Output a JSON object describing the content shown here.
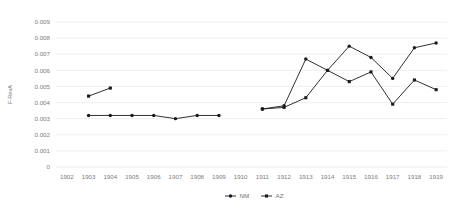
{
  "chart_data": {
    "type": "line",
    "title": "",
    "xlabel": "",
    "ylabel": "F-RevA",
    "ylim": [
      0,
      0.009
    ],
    "ytick_values": [
      0,
      0.001,
      0.002,
      0.003,
      0.004,
      0.005,
      0.006,
      0.007,
      0.008,
      0.009
    ],
    "ytick_labels": [
      "0",
      "0.001",
      "0.002",
      "0.003",
      "0.004",
      "0.005",
      "0.006",
      "0.007",
      "0.008",
      "0.009"
    ],
    "categories": [
      1902,
      1903,
      1904,
      1905,
      1906,
      1907,
      1908,
      1909,
      1910,
      1911,
      1912,
      1913,
      1914,
      1915,
      1916,
      1917,
      1918,
      1919
    ],
    "xtick_labels": [
      "1902",
      "1903",
      "1904",
      "1905",
      "1906",
      "1907",
      "1908",
      "1909",
      "1910",
      "1911",
      "1912",
      "1913",
      "1914",
      "1915",
      "1916",
      "1917",
      "1918",
      "1919"
    ],
    "grid": true,
    "grid_axis": "y",
    "legend_position": "bottom",
    "series": [
      {
        "name": "NM",
        "marker": "circle",
        "color": "#1a1a1a",
        "values": [
          null,
          0.0032,
          0.0032,
          0.0032,
          0.0032,
          0.003,
          0.0032,
          0.0032,
          null,
          0.0036,
          0.0038,
          0.0067,
          0.006,
          0.0075,
          0.0068,
          0.0055,
          0.0074,
          0.0077
        ]
      },
      {
        "name": "AZ",
        "marker": "square",
        "color": "#1a1a1a",
        "values": [
          null,
          0.0044,
          0.0049,
          null,
          null,
          null,
          null,
          null,
          null,
          0.0036,
          0.0037,
          0.0043,
          0.006,
          0.0053,
          0.0059,
          0.0039,
          0.0054,
          0.0048
        ]
      }
    ]
  },
  "legend": {
    "entries": [
      {
        "label": "NM",
        "marker": "circle"
      },
      {
        "label": "AZ",
        "marker": "square"
      }
    ]
  }
}
